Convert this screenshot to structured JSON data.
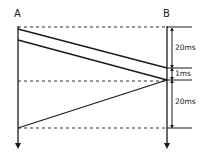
{
  "diagram": {
    "nodes": [
      {
        "id": "A",
        "label": "A"
      },
      {
        "id": "B",
        "label": "B"
      }
    ],
    "intervals": [
      {
        "label": "20ms"
      },
      {
        "label": "1ms"
      },
      {
        "label": "20ms"
      }
    ],
    "colors": {
      "line": "#1a1a1a",
      "background": "#ffffff"
    }
  }
}
